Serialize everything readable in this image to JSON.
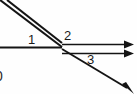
{
  "diagram": {
    "type": "ray-junction-vector-diagram",
    "background_color": "#fefefe",
    "stroke_color": "#141414",
    "junction": {
      "x": 62,
      "y": 47
    },
    "labels": [
      {
        "id": "1",
        "text": "1",
        "x": 28,
        "y": 33,
        "describes": "incoming-horizontal-ray"
      },
      {
        "id": "2",
        "text": "2",
        "x": 64,
        "y": 29,
        "describes": "outgoing-horizontal-rays"
      },
      {
        "id": "3",
        "text": "3",
        "x": 87,
        "y": 53,
        "describes": "outgoing-diagonal-ray"
      }
    ],
    "clipped_glyph": {
      "text": "0",
      "x": -5,
      "y": 69
    },
    "rays": [
      {
        "name": "upper-diagonal-line-a",
        "from": {
          "x": 0,
          "y": 0
        },
        "to": {
          "x": 62,
          "y": 47
        },
        "arrow": false
      },
      {
        "name": "upper-diagonal-line-b",
        "from": {
          "x": 6,
          "y": 0
        },
        "to": {
          "x": 62,
          "y": 44
        },
        "arrow": false
      },
      {
        "name": "incoming-horizontal-ray",
        "from": {
          "x": 0,
          "y": 47
        },
        "to": {
          "x": 62,
          "y": 47
        },
        "arrow": false
      },
      {
        "name": "outgoing-horizontal-ray-upper",
        "from": {
          "x": 62,
          "y": 45
        },
        "to": {
          "x": 128,
          "y": 45
        },
        "arrow": true
      },
      {
        "name": "outgoing-horizontal-ray-lower",
        "from": {
          "x": 62,
          "y": 53
        },
        "to": {
          "x": 128,
          "y": 53
        },
        "arrow": true
      },
      {
        "name": "outgoing-diagonal-ray",
        "from": {
          "x": 62,
          "y": 49
        },
        "to": {
          "x": 133,
          "y": 92
        },
        "arrow": true
      }
    ]
  }
}
